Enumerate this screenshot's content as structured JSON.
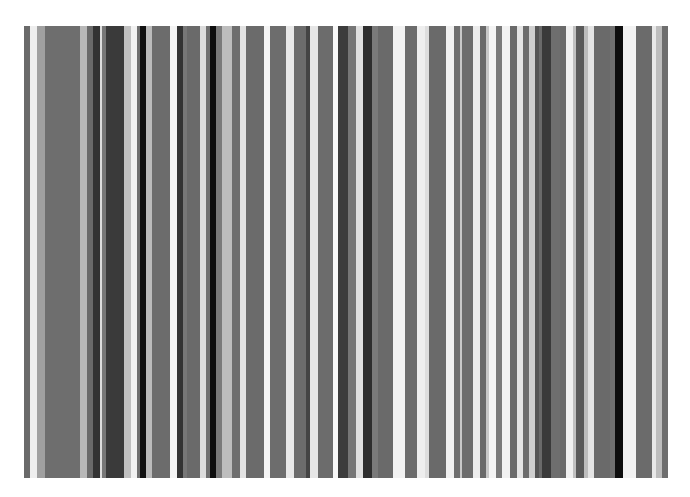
{
  "image": {
    "description": "Vertical grayscale stripe pattern (barcode-like)",
    "background": "#ffffff",
    "region": {
      "top": 26,
      "bottom": 478,
      "left": 24,
      "right": 668
    }
  },
  "stripes": [
    {
      "x": 24,
      "w": 6,
      "color": "#6a6a6a"
    },
    {
      "x": 30,
      "w": 7,
      "color": "#eeeeee"
    },
    {
      "x": 37,
      "w": 8,
      "color": "#a0a0a0"
    },
    {
      "x": 45,
      "w": 35,
      "color": "#6e6e6e"
    },
    {
      "x": 80,
      "w": 7,
      "color": "#b8b8b8"
    },
    {
      "x": 87,
      "w": 6,
      "color": "#6a6a6a"
    },
    {
      "x": 93,
      "w": 7,
      "color": "#333333"
    },
    {
      "x": 100,
      "w": 2,
      "color": "#dddddd"
    },
    {
      "x": 102,
      "w": 4,
      "color": "#777777"
    },
    {
      "x": 106,
      "w": 18,
      "color": "#3a3a3a"
    },
    {
      "x": 124,
      "w": 7,
      "color": "#c0c0c0"
    },
    {
      "x": 131,
      "w": 6,
      "color": "#f2f2f2"
    },
    {
      "x": 137,
      "w": 3,
      "color": "#707070"
    },
    {
      "x": 140,
      "w": 6,
      "color": "#111111"
    },
    {
      "x": 146,
      "w": 6,
      "color": "#bbbbbb"
    },
    {
      "x": 152,
      "w": 18,
      "color": "#6c6c6c"
    },
    {
      "x": 170,
      "w": 7,
      "color": "#f4f4f4"
    },
    {
      "x": 177,
      "w": 6,
      "color": "#333333"
    },
    {
      "x": 183,
      "w": 4,
      "color": "#777777"
    },
    {
      "x": 187,
      "w": 13,
      "color": "#6a6a6a"
    },
    {
      "x": 200,
      "w": 6,
      "color": "#dcdcdc"
    },
    {
      "x": 206,
      "w": 4,
      "color": "#707070"
    },
    {
      "x": 210,
      "w": 6,
      "color": "#0e0e0e"
    },
    {
      "x": 216,
      "w": 6,
      "color": "#7a7a7a"
    },
    {
      "x": 222,
      "w": 10,
      "color": "#bdbdbd"
    },
    {
      "x": 232,
      "w": 8,
      "color": "#6e6e6e"
    },
    {
      "x": 240,
      "w": 6,
      "color": "#e2e2e2"
    },
    {
      "x": 246,
      "w": 18,
      "color": "#6b6b6b"
    },
    {
      "x": 264,
      "w": 6,
      "color": "#f4f4f4"
    },
    {
      "x": 270,
      "w": 16,
      "color": "#6d6d6d"
    },
    {
      "x": 286,
      "w": 8,
      "color": "#e8e8e8"
    },
    {
      "x": 294,
      "w": 12,
      "color": "#6c6c6c"
    },
    {
      "x": 306,
      "w": 4,
      "color": "#444444"
    },
    {
      "x": 310,
      "w": 8,
      "color": "#e6e6e6"
    },
    {
      "x": 318,
      "w": 15,
      "color": "#6c6c6c"
    },
    {
      "x": 333,
      "w": 5,
      "color": "#f8f8f8"
    },
    {
      "x": 338,
      "w": 10,
      "color": "#3c3c3c"
    },
    {
      "x": 348,
      "w": 8,
      "color": "#767676"
    },
    {
      "x": 356,
      "w": 7,
      "color": "#e0e0e0"
    },
    {
      "x": 363,
      "w": 9,
      "color": "#2e2e2e"
    },
    {
      "x": 372,
      "w": 6,
      "color": "#7a7a7a"
    },
    {
      "x": 378,
      "w": 15,
      "color": "#6a6a6a"
    },
    {
      "x": 393,
      "w": 12,
      "color": "#f2f2f2"
    },
    {
      "x": 405,
      "w": 12,
      "color": "#6c6c6c"
    },
    {
      "x": 417,
      "w": 8,
      "color": "#eeeeee"
    },
    {
      "x": 425,
      "w": 4,
      "color": "#dddddd"
    },
    {
      "x": 429,
      "w": 17,
      "color": "#6a6a6a"
    },
    {
      "x": 446,
      "w": 8,
      "color": "#f0f0f0"
    },
    {
      "x": 454,
      "w": 6,
      "color": "#6e6e6e"
    },
    {
      "x": 460,
      "w": 2,
      "color": "#c8c8c8"
    },
    {
      "x": 462,
      "w": 11,
      "color": "#6c6c6c"
    },
    {
      "x": 473,
      "w": 7,
      "color": "#ececec"
    },
    {
      "x": 480,
      "w": 6,
      "color": "#6a6a6a"
    },
    {
      "x": 486,
      "w": 3,
      "color": "#c8c8c8"
    },
    {
      "x": 489,
      "w": 7,
      "color": "#f4f4f4"
    },
    {
      "x": 496,
      "w": 6,
      "color": "#7a7a7a"
    },
    {
      "x": 502,
      "w": 8,
      "color": "#f2f2f2"
    },
    {
      "x": 510,
      "w": 7,
      "color": "#6a6a6a"
    },
    {
      "x": 517,
      "w": 6,
      "color": "#e4e4e4"
    },
    {
      "x": 523,
      "w": 6,
      "color": "#6c6c6c"
    },
    {
      "x": 529,
      "w": 6,
      "color": "#cfcfcf"
    },
    {
      "x": 535,
      "w": 4,
      "color": "#555555"
    },
    {
      "x": 539,
      "w": 3,
      "color": "#6a6a6a"
    },
    {
      "x": 542,
      "w": 9,
      "color": "#3a3a3a"
    },
    {
      "x": 551,
      "w": 9,
      "color": "#6e6e6e"
    },
    {
      "x": 560,
      "w": 6,
      "color": "#6a6a6a"
    },
    {
      "x": 566,
      "w": 7,
      "color": "#f0f0f0"
    },
    {
      "x": 573,
      "w": 3,
      "color": "#c0c0c0"
    },
    {
      "x": 576,
      "w": 8,
      "color": "#5a5a5a"
    },
    {
      "x": 584,
      "w": 4,
      "color": "#bdbdbd"
    },
    {
      "x": 588,
      "w": 6,
      "color": "#e4e4e4"
    },
    {
      "x": 594,
      "w": 16,
      "color": "#6a6a6a"
    },
    {
      "x": 610,
      "w": 5,
      "color": "#707070"
    },
    {
      "x": 615,
      "w": 8,
      "color": "#0e0e0e"
    },
    {
      "x": 623,
      "w": 13,
      "color": "#f2f2f2"
    },
    {
      "x": 636,
      "w": 16,
      "color": "#6b6b6b"
    },
    {
      "x": 652,
      "w": 4,
      "color": "#e8e8e8"
    },
    {
      "x": 656,
      "w": 6,
      "color": "#bdbdbd"
    },
    {
      "x": 662,
      "w": 6,
      "color": "#6e6e6e"
    }
  ]
}
